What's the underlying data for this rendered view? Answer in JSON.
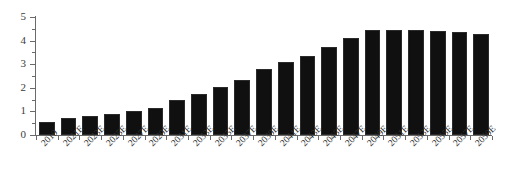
{
  "chart_data": {
    "type": "bar",
    "title": "",
    "subtitle": "",
    "xlabel": "",
    "ylabel": "",
    "ylim": [
      0,
      5
    ],
    "y_ticks": [
      0,
      1,
      2,
      3,
      4,
      5
    ],
    "y_tick_labels": [
      "0",
      "1",
      "2",
      "3",
      "4",
      "5"
    ],
    "y_minor_ticks": [
      0.5,
      1.5,
      2.5,
      3.5,
      4.5
    ],
    "grid": false,
    "legend": null,
    "bar_color": "#101010",
    "axis_color": "#6a6a6a",
    "categories": [
      "2019",
      "2021E",
      "2023E",
      "2025E",
      "2027E",
      "2029E",
      "2031E",
      "2033E",
      "2035E",
      "2037E",
      "2039E",
      "2041E",
      "2043E",
      "2045E",
      "2047E",
      "2049E",
      "2051E",
      "2053E",
      "2055E",
      "2057E",
      "2059E"
    ],
    "values": [
      0.55,
      0.7,
      0.8,
      0.9,
      1.0,
      1.15,
      1.5,
      1.75,
      2.05,
      2.35,
      2.8,
      3.1,
      3.35,
      3.75,
      4.1,
      4.45,
      4.45,
      4.45,
      4.4,
      4.35,
      4.3
    ],
    "x_tick_labels": [
      "2019",
      "2021E",
      "2023E",
      "2025E",
      "2027E",
      "2029E",
      "2031E",
      "2033E",
      "2035E",
      "2037E",
      "2039E",
      "2041E",
      "2043E",
      "2045E",
      "2047E",
      "2049E",
      "2051E",
      "2053E",
      "2055E",
      "2057E",
      "2059E"
    ]
  }
}
